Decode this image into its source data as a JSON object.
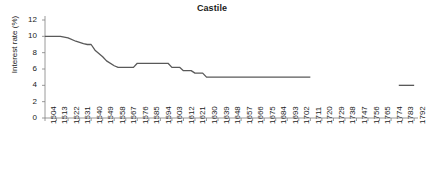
{
  "chart_data": {
    "type": "line",
    "title": "Castile",
    "xlabel": "",
    "ylabel": "Interest rate (%)",
    "ylim": [
      0,
      12
    ],
    "yticks": [
      0,
      2,
      4,
      6,
      8,
      10,
      12
    ],
    "xlim": [
      1504,
      1795
    ],
    "grid": false,
    "legend": null,
    "line_color": "#595959",
    "axis_color": "#808080",
    "xticks": [
      1504,
      1513,
      1522,
      1531,
      1540,
      1549,
      1558,
      1567,
      1576,
      1585,
      1594,
      1603,
      1612,
      1621,
      1630,
      1639,
      1648,
      1657,
      1666,
      1675,
      1684,
      1693,
      1702,
      1711,
      1720,
      1729,
      1738,
      1747,
      1756,
      1765,
      1774,
      1783,
      1792
    ],
    "series": [
      {
        "name": "Castile interest rate",
        "x": [
          1504,
          1516,
          1522,
          1528,
          1534,
          1537,
          1540,
          1543,
          1549,
          1552,
          1558,
          1561,
          1567,
          1573,
          1576,
          1585,
          1588,
          1594,
          1600,
          1603,
          1609,
          1612,
          1618,
          1621,
          1627,
          1630,
          1636,
          1642,
          1660,
          1680,
          1700,
          1711
        ],
        "y": [
          10.0,
          10.0,
          9.8,
          9.4,
          9.1,
          9.0,
          9.0,
          8.3,
          7.5,
          7.0,
          6.4,
          6.2,
          6.2,
          6.2,
          6.7,
          6.7,
          6.7,
          6.7,
          6.7,
          6.2,
          6.2,
          5.8,
          5.8,
          5.5,
          5.5,
          5.0,
          5.0,
          5.0,
          5.0,
          5.0,
          5.0,
          5.0
        ]
      },
      {
        "name": "Castile interest rate (late segment)",
        "x": [
          1780,
          1792
        ],
        "y": [
          4.0,
          4.0
        ]
      }
    ]
  }
}
